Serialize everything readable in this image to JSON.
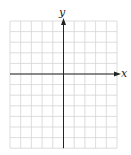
{
  "diagram": {
    "type": "coordinate-grid",
    "x_axis_label": "x",
    "y_axis_label": "y",
    "grid": {
      "columns": 10,
      "rows": 12,
      "left": 10,
      "top": 21,
      "cell_w": 10.7,
      "cell_h": 10.6
    },
    "origin": {
      "col": 5,
      "row": 5
    },
    "colors": {
      "grid": "#d4d4d4",
      "axis": "#222222",
      "background": "#ffffff"
    }
  }
}
